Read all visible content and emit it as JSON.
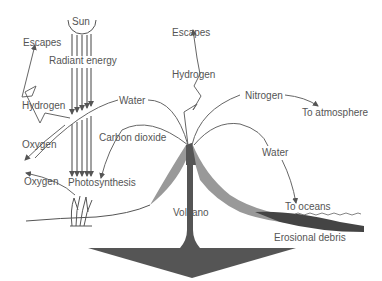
{
  "diagram": {
    "labels": {
      "sun": "Sun",
      "radiant_energy": "Radiant energy",
      "escapes_left": "Escapes",
      "hydrogen_left": "Hydrogen",
      "water_left": "Water",
      "oxygen_1": "Oxygen",
      "oxygen_2": "Oxygen",
      "carbon_dioxide": "Carbon dioxide",
      "photosynthesis": "Photosynthesis",
      "escapes_top": "Escapes",
      "hydrogen_top": "Hydrogen",
      "nitrogen": "Nitrogen",
      "to_atmosphere": "To atmosphere",
      "water_right": "Water",
      "volcano": "Volcano",
      "to_oceans": "To oceans",
      "erosional_debris": "Erosional debris"
    },
    "colors": {
      "line": "#666666",
      "text": "#555555",
      "volcano_dark": "#555555",
      "volcano_light": "#999999"
    }
  }
}
